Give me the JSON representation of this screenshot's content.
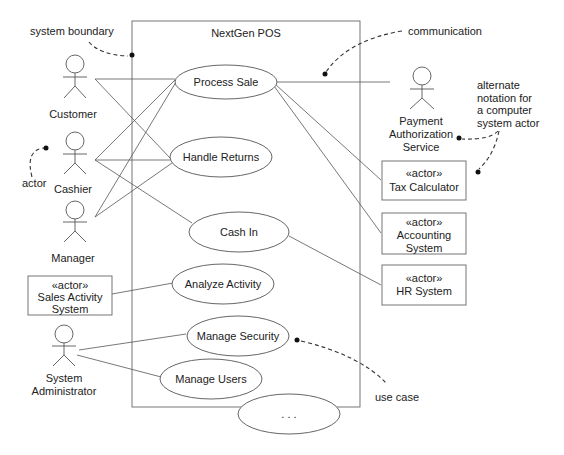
{
  "system": {
    "title": "NextGen POS"
  },
  "actors": {
    "customer": "Customer",
    "cashier": "Cashier",
    "manager": "Manager",
    "payment": [
      "Payment",
      "Authorization",
      "Service"
    ],
    "sysadmin": [
      "System",
      "Administrator"
    ]
  },
  "system_actors": {
    "stereotype": "«actor»",
    "tax": [
      "Tax Calculator"
    ],
    "accounting": [
      "Accounting",
      "System"
    ],
    "hr": [
      "HR System"
    ],
    "sales": [
      "Sales Activity",
      "System"
    ]
  },
  "use_cases": {
    "process_sale": "Process Sale",
    "handle_returns": "Handle Returns",
    "cash_in": "Cash In",
    "analyze_activity": "Analyze Activity",
    "manage_security": "Manage Security",
    "manage_users": "Manage Users",
    "more": ". . ."
  },
  "annotations": {
    "system_boundary": "system boundary",
    "communication": "communication",
    "alternate": [
      "alternate",
      "notation for",
      "a computer",
      "system actor"
    ],
    "actor": "actor",
    "use_case": "use case"
  }
}
